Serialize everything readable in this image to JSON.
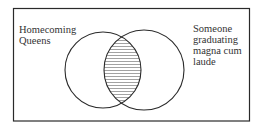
{
  "diagram": {
    "type": "venn",
    "sets": [
      {
        "label": "Homecoming\nQueens"
      },
      {
        "label": "Someone\ngraduating\nmagna cum\nlaude"
      }
    ],
    "shaded_region": "intersection",
    "shading_style": "horizontal-lines",
    "colors": {
      "stroke": "#2a2a2a",
      "background": "#ffffff",
      "hatch": "#8a8a8a"
    }
  }
}
